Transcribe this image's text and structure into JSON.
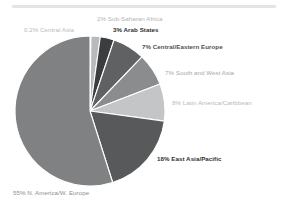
{
  "page": {
    "background_color": "#ffffff",
    "divider_color": "#e3e4e6"
  },
  "chart_data": {
    "type": "pie",
    "title": "",
    "subtitle": "",
    "xlabel": "",
    "ylabel": "",
    "legend_position": "none",
    "grid": false,
    "start_angle_deg": 0,
    "direction": "clockwise",
    "total_percent": 100.2,
    "categories": [
      "Central Asia",
      "Sub-Saharan Africa",
      "Arab States",
      "Central/Eastern Europe",
      "South and West Asia",
      "Latin America/Caribbean",
      "East Asia/Pacific",
      "N. America/W. Europe"
    ],
    "values": [
      0.2,
      2,
      3,
      7,
      7,
      8,
      18,
      55
    ],
    "colors": [
      "#d9dadc",
      "#b9babc",
      "#3b3d3f",
      "#5f6163",
      "#8a8c8e",
      "#c3c5c7",
      "#58595b",
      "#7f8183"
    ],
    "slice_separator_color": "#ffffff",
    "labels": [
      {
        "key": "central_asia",
        "text": "0.2% Central Asia",
        "percent_text": "0.2%",
        "name_text": "Central Asia",
        "color": "#b9bbbd",
        "bold": false
      },
      {
        "key": "sub_saharan_africa",
        "text": "2% Sub-Saharan Africa",
        "percent_text": "2%",
        "name_text": "Sub-Saharan Africa",
        "color": "#b2b4b6",
        "bold": false
      },
      {
        "key": "arab_states",
        "text": "3% Arab States",
        "percent_text": "3%",
        "name_text": "Arab States",
        "color": "#2e2f31",
        "bold": true
      },
      {
        "key": "central_eastern_europe",
        "text": "7% Central/Eastern Europe",
        "percent_text": "7%",
        "name_text": "Central/Eastern Europe",
        "color": "#4e5052",
        "bold": true
      },
      {
        "key": "south_and_west_asia",
        "text": "7% South and West Asia",
        "percent_text": "7%",
        "name_text": "South and West Asia",
        "color": "#a6a8aa",
        "bold": false
      },
      {
        "key": "latin_america_caribbean",
        "text": "8% Latin America/Caribbean",
        "percent_text": "8%",
        "name_text": "Latin America/Caribbean",
        "color": "#b7b9bb",
        "bold": false
      },
      {
        "key": "east_asia_pacific",
        "text": "18% East Asia/Pacific",
        "percent_text": "18%",
        "name_text": "East Asia/Pacific",
        "color": "#2f3133",
        "bold": true
      },
      {
        "key": "north_america_west_europe",
        "text": "55% N. America/W. Europe",
        "percent_text": "55%",
        "name_text": "N. America/W. Europe",
        "color": "#8e9092",
        "bold": false
      }
    ],
    "geometry": {
      "center_x": 90,
      "center_y": 111,
      "radius": 75
    }
  }
}
